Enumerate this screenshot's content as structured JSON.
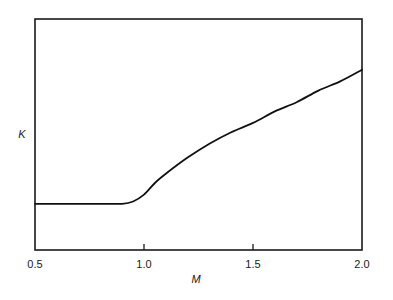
{
  "chart_data": {
    "type": "line",
    "title": "",
    "xlabel": "M",
    "ylabel": "K",
    "xlim": [
      0.5,
      2.0
    ],
    "ylim": [
      0,
      1
    ],
    "y_units": "normalized (no y tick labels shown)",
    "grid": false,
    "legend": null,
    "x_ticks": [
      0.5,
      1.0,
      1.5,
      2.0
    ],
    "x_tick_labels": [
      "0.5",
      "1.0",
      "1.5",
      "2.0"
    ],
    "series": [
      {
        "name": "K(M)",
        "x": [
          0.5,
          0.6,
          0.7,
          0.8,
          0.9,
          0.95,
          1.0,
          1.05,
          1.1,
          1.2,
          1.3,
          1.4,
          1.5,
          1.6,
          1.7,
          1.8,
          1.9,
          2.0
        ],
        "y": [
          0.2,
          0.2,
          0.2,
          0.2,
          0.2,
          0.21,
          0.24,
          0.29,
          0.33,
          0.4,
          0.46,
          0.51,
          0.55,
          0.6,
          0.64,
          0.69,
          0.73,
          0.78
        ]
      }
    ]
  },
  "labels": {
    "x_axis": "M",
    "y_axis": "K",
    "x_ticks": [
      "0.5",
      "1.0",
      "1.5",
      "2.0"
    ]
  }
}
